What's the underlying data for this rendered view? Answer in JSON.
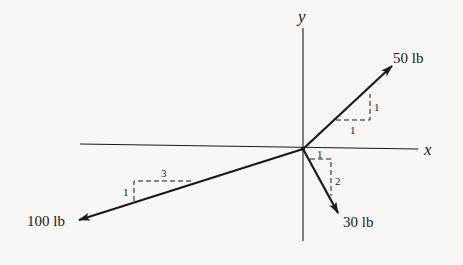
{
  "diagram": {
    "type": "force-vector diagram",
    "axes": {
      "x_label": "x",
      "y_label": "y"
    },
    "forces": [
      {
        "magnitude_label": "50 lb",
        "slope": {
          "rise": "1",
          "run": "1"
        },
        "direction": "up-right"
      },
      {
        "magnitude_label": "30 lb",
        "slope": {
          "horizontal": "1",
          "vertical": "2"
        },
        "direction": "down-right"
      },
      {
        "magnitude_label": "100 lb",
        "slope": {
          "horizontal": "3",
          "vertical": "1"
        },
        "direction": "down-left"
      }
    ],
    "colors": {
      "background": "#f7f7f5",
      "ink": "#1a1a1a"
    }
  }
}
